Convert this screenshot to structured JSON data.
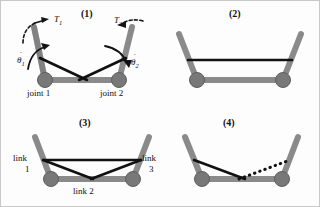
{
  "figure": {
    "background_color": "#fdfdfd",
    "link_color": "#8a8a8a",
    "joint_color": "#777777",
    "tendon_color": "#111111",
    "outline_color": "#5f5f5f"
  },
  "panels": [
    {
      "id": "panel-1",
      "label": "(1)",
      "annotations": {
        "torque_left": "T",
        "torque_left_sub": "1",
        "torque_right": "T",
        "torque_right_sub": "2",
        "omega_left": "θ",
        "omega_left_sub": "1",
        "omega_right": "θ",
        "omega_right_sub": "2",
        "joint_left": "joint 1",
        "joint_right": "joint 2"
      }
    },
    {
      "id": "panel-2",
      "label": "(2)",
      "annotations": {}
    },
    {
      "id": "panel-3",
      "label": "(3)",
      "annotations": {
        "link_left_line1": "link",
        "link_left_line2": "1",
        "link_right_line1": "link",
        "link_right_line2": "3",
        "link_bottom": "link 2"
      }
    },
    {
      "id": "panel-4",
      "label": "(4)",
      "annotations": {}
    }
  ]
}
